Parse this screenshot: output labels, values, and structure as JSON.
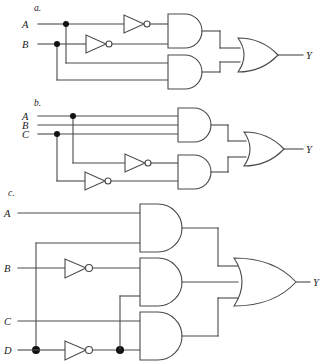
{
  "figure": {
    "background_color": "#ffffff",
    "line_color": "#4a4a4a",
    "text_color": "#1a1a1a",
    "width": 327,
    "height": 362
  },
  "sections": [
    {
      "id": "a",
      "label": "a.",
      "inputs": [
        "A",
        "B"
      ],
      "output": "Y",
      "gates": [
        "not",
        "not",
        "and",
        "and",
        "or"
      ],
      "expression": "Y = (A' . B') + (A . B)"
    },
    {
      "id": "b",
      "label": "b.",
      "inputs": [
        "A",
        "B",
        "C"
      ],
      "output": "Y",
      "gates": [
        "not",
        "not",
        "and",
        "and",
        "or"
      ],
      "expression": "Y = (A . B . C) + (A' . C')"
    },
    {
      "id": "c",
      "label": "c.",
      "inputs": [
        "A",
        "B",
        "C",
        "D"
      ],
      "output": "Y",
      "gates": [
        "not",
        "not",
        "and",
        "and",
        "and",
        "or"
      ],
      "expression": "Y = (A . D) + (B' . D') + (C . D')"
    }
  ],
  "labels": {
    "section_a": "a.",
    "section_b": "b.",
    "section_c": "c.",
    "input_A": "A",
    "input_B": "B",
    "input_C": "C",
    "input_D": "D",
    "output_Y": "Y"
  }
}
